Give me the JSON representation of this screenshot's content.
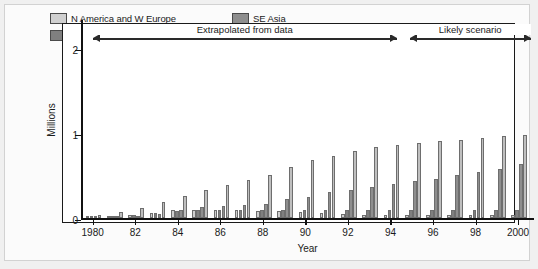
{
  "chart_data": {
    "type": "bar",
    "title": "",
    "xlabel": "Year",
    "ylabel": "Millions",
    "ylim": [
      0,
      2.35
    ],
    "ytick_values": [
      0,
      1,
      2
    ],
    "ytick_labels": [
      "0",
      "1",
      "2"
    ],
    "grid": false,
    "legend_position": "top-inside",
    "categories": [
      1980,
      1981,
      1982,
      1983,
      1984,
      1985,
      1986,
      1987,
      1988,
      1989,
      1990,
      1991,
      1992,
      1993,
      1994,
      1995,
      1996,
      1997,
      1998,
      1999,
      2000
    ],
    "xtick_labels": [
      "1980",
      "82",
      "84",
      "86",
      "88",
      "90",
      "92",
      "94",
      "96",
      "98",
      "2000"
    ],
    "xtick_years": [
      1980,
      1982,
      1984,
      1986,
      1988,
      1990,
      1992,
      1994,
      1996,
      1998,
      2000
    ],
    "series": [
      {
        "name": "N America and W Europe",
        "color": "#d0d0d0",
        "values": [
          0.01,
          0.02,
          0.03,
          0.06,
          0.09,
          0.1,
          0.09,
          0.09,
          0.08,
          0.08,
          0.07,
          0.06,
          0.05,
          0.04,
          0.04,
          0.04,
          0.03,
          0.03,
          0.03,
          0.03,
          0.03
        ]
      },
      {
        "name": "L America and Caribbean",
        "color": "#7f7f7f",
        "values": [
          0.01,
          0.02,
          0.04,
          0.06,
          0.08,
          0.09,
          0.09,
          0.1,
          0.1,
          0.1,
          0.1,
          0.1,
          0.09,
          0.09,
          0.09,
          0.09,
          0.09,
          0.09,
          0.09,
          0.09,
          0.09
        ]
      },
      {
        "name": "SE Asia",
        "color": "#8e8e8e",
        "values": [
          0.01,
          0.01,
          0.02,
          0.05,
          0.1,
          0.13,
          0.14,
          0.15,
          0.17,
          0.22,
          0.25,
          0.3,
          0.33,
          0.37,
          0.4,
          0.44,
          0.46,
          0.5,
          0.54,
          0.58,
          0.63
        ]
      },
      {
        "name": "SS Africa",
        "color": "#bfbfbf",
        "values": [
          0.03,
          0.07,
          0.12,
          0.19,
          0.26,
          0.33,
          0.39,
          0.45,
          0.51,
          0.6,
          0.68,
          0.73,
          0.79,
          0.83,
          0.86,
          0.88,
          0.9,
          0.92,
          0.94,
          0.96,
          0.98
        ]
      }
    ],
    "annotations": [
      {
        "text": "Extrapolated from data",
        "start_year": 1980,
        "end_year": 1994.3,
        "y_value": 2.18
      },
      {
        "text": "Likely scenario",
        "start_year": 1994.9,
        "end_year": 2000.6,
        "y_value": 2.18
      }
    ]
  },
  "legend": {
    "items": [
      {
        "label": "N America and W Europe",
        "color": "#d0d0d0"
      },
      {
        "label": "L America and Caribbean",
        "color": "#7f7f7f"
      },
      {
        "label": "SE Asia",
        "color": "#8e8e8e"
      },
      {
        "label": "SS Africa",
        "color": "#bfbfbf"
      }
    ]
  }
}
